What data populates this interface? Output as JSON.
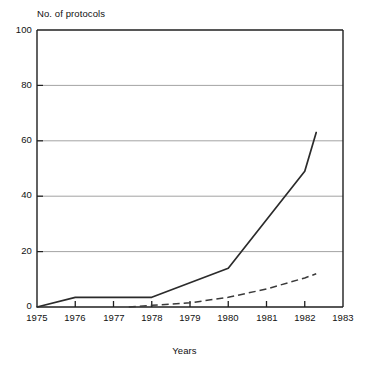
{
  "chart_data": {
    "type": "line",
    "title": "",
    "ylabel": "No. of protocols",
    "xlabel": "Years",
    "xlim": [
      1975,
      1983
    ],
    "ylim": [
      0,
      100
    ],
    "grid": true,
    "legend": "none",
    "x_ticks": [
      "1975",
      "1976",
      "1977",
      "1978",
      "1979",
      "1980",
      "1981",
      "1982",
      "1983"
    ],
    "y_ticks": [
      "0",
      "20",
      "40",
      "60",
      "80",
      "100"
    ],
    "series": [
      {
        "name": "solid-line",
        "style": "solid",
        "color": "#2b2b2b",
        "x": [
          1975,
          1976,
          1977,
          1978,
          1980,
          1982,
          1982.3
        ],
        "values": [
          0,
          3.5,
          3.5,
          3.5,
          14,
          49,
          63
        ]
      },
      {
        "name": "dashed-line",
        "style": "dashed",
        "color": "#3a3a3a",
        "x": [
          1977.4,
          1978,
          1979,
          1980,
          1981,
          1982,
          1982.3
        ],
        "values": [
          0,
          0.6,
          1.5,
          3.5,
          6.5,
          10.5,
          12
        ]
      }
    ]
  },
  "axes": {
    "y_axis_title": "No. of protocols",
    "x_axis_title": "Years",
    "y_tick_labels": [
      "100",
      "80",
      "60",
      "40",
      "20",
      "0"
    ],
    "x_tick_labels": [
      "1975",
      "1976",
      "1977",
      "1978",
      "1979",
      "1980",
      "1981",
      "1982",
      "1983"
    ]
  },
  "colors": {
    "background": "#ffffff",
    "frame": "#1f1f1f",
    "gridline": "#8c8c8c",
    "solid_series": "#2b2b2b",
    "dashed_series": "#3a3a3a",
    "text": "#111111"
  },
  "caption": {
    "partial_text": ""
  }
}
